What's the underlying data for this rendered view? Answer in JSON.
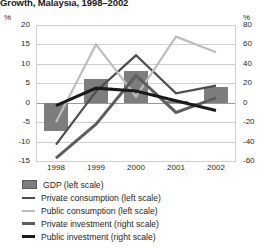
{
  "chart_data": {
    "type": "bar",
    "title": "Growth, Malaysia, 1998–2002",
    "categories": [
      "1998",
      "1999",
      "2000",
      "2001",
      "2002"
    ],
    "x": [
      1998,
      1999,
      2000,
      2001,
      2002
    ],
    "xlabel": "",
    "ylabel": "%",
    "y2label": "%",
    "ylim": [
      -15,
      20
    ],
    "y2lim": [
      -60,
      80
    ],
    "yticks": [
      20,
      15,
      10,
      5,
      0,
      -5,
      -10,
      -15
    ],
    "ytick_labels": [
      "20",
      "15",
      "10",
      "5",
      "0",
      "-5",
      "-10",
      "-15"
    ],
    "y2ticks": [
      80,
      60,
      40,
      20,
      0,
      -20,
      -40,
      -60
    ],
    "y2tick_labels": [
      "80",
      "60",
      "40",
      "20",
      "0",
      "-20",
      "-40",
      "-60"
    ],
    "grid": true,
    "legend_position": "below",
    "series": [
      {
        "name": "GDP (left scale)",
        "type": "bar",
        "axis": "left",
        "color": "#7d7d7d",
        "values": [
          -7.4,
          6.1,
          8.3,
          0.4,
          4.1
        ]
      },
      {
        "name": "Private consumption (left scale)",
        "type": "line",
        "axis": "left",
        "color": "#4d4d4d",
        "values": [
          -10.8,
          2.9,
          12.2,
          2.4,
          4.4
        ]
      },
      {
        "name": "Public consumption (left scale)",
        "type": "line",
        "axis": "left",
        "color": "#bdbdbd",
        "values": [
          -5.0,
          15.0,
          1.6,
          17.0,
          13.0
        ]
      },
      {
        "name": "Private investment (right scale)",
        "type": "line",
        "axis": "right",
        "color": "#5e5e5e",
        "values": [
          -57.0,
          -22.0,
          28.0,
          -10.0,
          5.0
        ]
      },
      {
        "name": "Public investment (right scale)",
        "type": "line",
        "axis": "right",
        "color": "#1a1a1a",
        "values": [
          -3.0,
          15.0,
          12.0,
          2.0,
          -8.0
        ]
      }
    ]
  },
  "legend": {
    "items": [
      {
        "label": "GDP (left scale)",
        "kind": "bar",
        "color": "#7d7d7d",
        "thickness": 0
      },
      {
        "label": "Private consumption (left scale)",
        "kind": "line",
        "color": "#4d4d4d",
        "thickness": 2
      },
      {
        "label": "Public consumption (left scale)",
        "kind": "line",
        "color": "#bdbdbd",
        "thickness": 2
      },
      {
        "label": "Private investment (right scale)",
        "kind": "line",
        "color": "#5e5e5e",
        "thickness": 3
      },
      {
        "label": "Public investment (right scale)",
        "kind": "line",
        "color": "#1a1a1a",
        "thickness": 3
      }
    ]
  }
}
